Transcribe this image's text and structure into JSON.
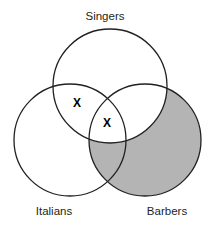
{
  "figure": {
    "type": "venn-diagram",
    "background_color": "#ffffff",
    "outline_color": "#231f20",
    "shade_color": "#b4b4b4",
    "mark_color": "#000000"
  },
  "sets": [
    {
      "id": "singers",
      "label": "Singers",
      "label_x": 105,
      "label_y": 20,
      "cx": 110,
      "cy": 86,
      "r": 57,
      "shaded": false
    },
    {
      "id": "italians",
      "label": "Italians",
      "label_x": 54,
      "label_y": 215,
      "cx": 70,
      "cy": 140,
      "r": 56,
      "shaded": false
    },
    {
      "id": "barbers",
      "label": "Barbers",
      "label_x": 167,
      "label_y": 215,
      "cx": 145,
      "cy": 140,
      "r": 56,
      "shaded": true
    }
  ],
  "shading": {
    "description": "Barbers circle shaded gray except the part overlapping Singers",
    "region": "barbers-minus-singers",
    "color": "#b4b4b4"
  },
  "marks": [
    {
      "id": "x-singers-italians",
      "symbol": "X",
      "x": 77,
      "y": 103,
      "region": "singers-and-italians-only"
    },
    {
      "id": "x-triple-overlap",
      "symbol": "X",
      "x": 107,
      "y": 123,
      "region": "singers-and-italians-and-barbers"
    }
  ]
}
